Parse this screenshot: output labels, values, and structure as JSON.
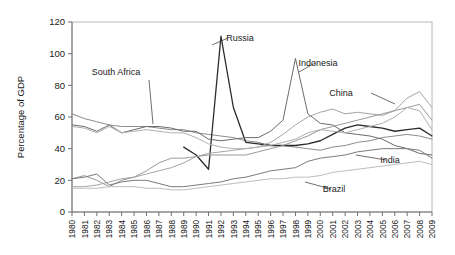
{
  "chart_data": {
    "type": "line",
    "title": "",
    "xlabel": "",
    "ylabel": "Percentage of GDP",
    "ylim": [
      0,
      120
    ],
    "yticks": [
      0,
      20,
      40,
      60,
      80,
      100,
      120
    ],
    "grid": false,
    "legend_position": "inline-annotations",
    "x": [
      1980,
      1981,
      1982,
      1983,
      1984,
      1985,
      1986,
      1987,
      1988,
      1989,
      1990,
      1991,
      1992,
      1993,
      1994,
      1995,
      1996,
      1997,
      1998,
      1999,
      2000,
      2001,
      2002,
      2003,
      2004,
      2005,
      2006,
      2007,
      2008,
      2009
    ],
    "categories": [
      "1980",
      "1981",
      "1982",
      "1983",
      "1984",
      "1985",
      "1986",
      "1987",
      "1988",
      "1989",
      "1990",
      "1991",
      "1992",
      "1993",
      "1994",
      "1995",
      "1996",
      "1997",
      "1998",
      "1999",
      "2000",
      "2001",
      "2002",
      "2003",
      "2004",
      "2005",
      "2006",
      "2007",
      "2008",
      "2009"
    ],
    "series": [
      {
        "name": "South Africa",
        "color": "#8c8c8c",
        "width": 1.0,
        "values": [
          62,
          59,
          57,
          55,
          54,
          54,
          54,
          53,
          52,
          52,
          50,
          49,
          48,
          47,
          45,
          44,
          42,
          42,
          41,
          40,
          39,
          41,
          42,
          44,
          45,
          47,
          48,
          49,
          48,
          46
        ]
      },
      {
        "name": "Russia",
        "color": "#2b2b2b",
        "width": 1.3,
        "values": [
          null,
          null,
          null,
          null,
          null,
          null,
          null,
          null,
          null,
          41,
          36,
          27,
          111,
          66,
          44,
          43,
          42,
          42,
          42,
          43,
          45,
          49,
          53,
          55,
          54,
          53,
          51,
          52,
          53,
          48
        ]
      },
      {
        "name": "Indonesia",
        "color": "#6b6b6b",
        "width": 1.0,
        "values": [
          55,
          54,
          51,
          55,
          50,
          52,
          54,
          54,
          53,
          51,
          51,
          46,
          45,
          46,
          47,
          47,
          51,
          58,
          97,
          62,
          56,
          55,
          50,
          49,
          48,
          46,
          42,
          40,
          37,
          36
        ]
      },
      {
        "name": "China",
        "color": "#a5a5a5",
        "width": 1.0,
        "values": [
          16,
          16,
          17,
          19,
          21,
          22,
          24,
          26,
          28,
          31,
          35,
          37,
          38,
          39,
          40,
          41,
          44,
          49,
          55,
          60,
          63,
          65,
          62,
          63,
          62,
          61,
          64,
          72,
          76,
          66
        ]
      },
      {
        "name": "India",
        "color": "#9a9a9a",
        "width": 1.0,
        "values": [
          21,
          23,
          20,
          16,
          20,
          22,
          26,
          31,
          34,
          34,
          35,
          36,
          36,
          36,
          36,
          38,
          40,
          42,
          45,
          48,
          52,
          54,
          56,
          58,
          60,
          62,
          64,
          66,
          68,
          58
        ]
      },
      {
        "name": "Brazil",
        "color": "#7a7a7a",
        "width": 1.0,
        "values": [
          21,
          22,
          24,
          17,
          19,
          20,
          20,
          18,
          16,
          16,
          17,
          18,
          19,
          21,
          22,
          24,
          26,
          27,
          28,
          32,
          34,
          35,
          36,
          38,
          39,
          40,
          40,
          40,
          39,
          34
        ]
      },
      {
        "name": "series-g",
        "color": "#bdbdbd",
        "width": 1.0,
        "values": [
          15,
          15,
          15,
          16,
          16,
          16,
          15,
          15,
          14,
          14,
          15,
          16,
          17,
          18,
          19,
          20,
          21,
          21,
          22,
          22,
          23,
          25,
          26,
          27,
          28,
          29,
          30,
          31,
          32,
          30
        ]
      },
      {
        "name": "series-h",
        "color": "#b0b0b0",
        "width": 1.0,
        "values": [
          54,
          53,
          50,
          54,
          50,
          51,
          52,
          51,
          50,
          50,
          47,
          43,
          41,
          40,
          40,
          41,
          42,
          44,
          46,
          50,
          52,
          51,
          50,
          52,
          54,
          56,
          60,
          66,
          64,
          52
        ]
      }
    ],
    "annotations": [
      {
        "label": "South Africa",
        "label_x": 116,
        "label_y": 75,
        "leader": [
          [
            149,
            80
          ],
          [
            153,
            124
          ]
        ]
      },
      {
        "label": "Russia",
        "label_x": 240,
        "label_y": 41,
        "leader": [
          [
            228,
            38
          ],
          [
            212,
            45
          ]
        ]
      },
      {
        "label": "Indonesia",
        "label_x": 318,
        "label_y": 66,
        "leader": [
          [
            315,
            63
          ],
          [
            299,
            72
          ]
        ]
      },
      {
        "label": "China",
        "label_x": 341,
        "label_y": 96,
        "leader": [
          [
            371,
            93
          ],
          [
            395,
            104
          ]
        ]
      },
      {
        "label": "India",
        "label_x": 390,
        "label_y": 163,
        "leader": [
          [
            386,
            160
          ],
          [
            356,
            155
          ]
        ]
      },
      {
        "label": "Brazil",
        "label_x": 334,
        "label_y": 192,
        "leader": [
          [
            331,
            189
          ],
          [
            305,
            182
          ]
        ]
      }
    ]
  },
  "axis": {
    "y_title": "Percentage of GDP",
    "y_ticks": [
      "0",
      "20",
      "40",
      "60",
      "80",
      "100",
      "120"
    ],
    "x_ticks": [
      "1980",
      "1981",
      "1982",
      "1983",
      "1984",
      "1985",
      "1986",
      "1987",
      "1988",
      "1989",
      "1990",
      "1991",
      "1992",
      "1993",
      "1994",
      "1995",
      "1996",
      "1997",
      "1998",
      "1999",
      "2000",
      "2001",
      "2002",
      "2003",
      "2004",
      "2005",
      "2006",
      "2007",
      "2008",
      "2009"
    ]
  },
  "colors": {
    "axis": "#6f6f6f",
    "frame": "#b8b8b8",
    "text": "#1a1a1a",
    "background": "#ffffff"
  }
}
